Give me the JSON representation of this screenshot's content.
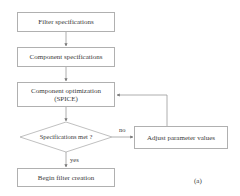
{
  "diagram": {
    "type": "flowchart",
    "nodes": {
      "filter_spec": "Filter specifications",
      "component_spec": "Component specifications",
      "component_opt_line1": "Component optimization",
      "component_opt_line2": "(SPICE)",
      "decision": "Specifications met ?",
      "adjust": "Adjust parameter values",
      "begin": "Begin filter creation"
    },
    "edges": {
      "no_label": "no",
      "yes_label": "yes"
    },
    "panel_label": "(a)",
    "colors": {
      "line": "#9a9a9a",
      "border": "#b0b0b0",
      "text": "#3a3a3a"
    }
  }
}
